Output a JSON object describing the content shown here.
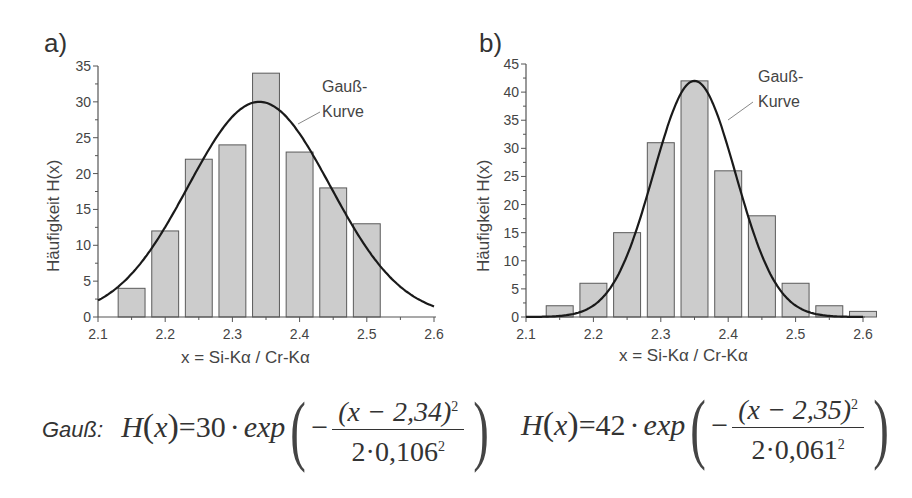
{
  "chart_data": [
    {
      "id": "a",
      "type": "bar",
      "panel_label": "a)",
      "title": "",
      "xlabel": "x = Si-Kα / Cr-Kα",
      "ylabel": "Häufigkeit H(x)",
      "xlim": [
        2.1,
        2.6
      ],
      "ylim": [
        0,
        35
      ],
      "x_ticks": [
        "2.1",
        "2.2",
        "2.3",
        "2.4",
        "2.5",
        "2.6"
      ],
      "y_ticks": [
        "0",
        "5",
        "10",
        "15",
        "20",
        "25",
        "30",
        "35"
      ],
      "grid": false,
      "bar_centers": [
        2.15,
        2.2,
        2.25,
        2.3,
        2.35,
        2.4,
        2.45,
        2.5
      ],
      "values": [
        4,
        12,
        22,
        24,
        34,
        23,
        18,
        13
      ],
      "bar_color": "#cccccc",
      "curve": {
        "name": "Gauß-Kurve",
        "type": "line",
        "amplitude": 30,
        "mean": 2.34,
        "sigma": 0.106
      },
      "annotation": [
        "Gauß-",
        "Kurve"
      ],
      "formula": {
        "prefix": "Gauß:",
        "lhs": "H(x) = 30 · exp",
        "numerator": "(x − 2,34)²",
        "denominator": "2·0,106²",
        "amplitude": "30",
        "mean": "2,34",
        "sigma": "0,106"
      }
    },
    {
      "id": "b",
      "type": "bar",
      "panel_label": "b)",
      "title": "",
      "xlabel": "x = Si-Kα / Cr-Kα",
      "ylabel": "Häufigkeit H(x)",
      "xlim": [
        2.1,
        2.6
      ],
      "ylim": [
        0,
        45
      ],
      "x_ticks": [
        "2.1",
        "2.2",
        "2.3",
        "2.4",
        "2.5",
        "2.6"
      ],
      "y_ticks": [
        "0",
        "5",
        "10",
        "15",
        "20",
        "25",
        "30",
        "35",
        "40",
        "45"
      ],
      "grid": false,
      "bar_centers": [
        2.15,
        2.2,
        2.25,
        2.3,
        2.35,
        2.4,
        2.45,
        2.5,
        2.55,
        2.6
      ],
      "values": [
        2,
        6,
        15,
        31,
        42,
        26,
        18,
        6,
        2,
        1
      ],
      "bar_color": "#cccccc",
      "curve": {
        "name": "Gauß-Kurve",
        "type": "line",
        "amplitude": 42,
        "mean": 2.35,
        "sigma": 0.061
      },
      "annotation": [
        "Gauß-",
        "Kurve"
      ],
      "formula": {
        "prefix": "",
        "lhs": "H(x) = 42 · exp",
        "numerator": "(x − 2,35)²",
        "denominator": "2·0,061²",
        "amplitude": "42",
        "mean": "2,35",
        "sigma": "0,061"
      }
    }
  ],
  "panels": {
    "a": {
      "label": "a)",
      "xlabel": "x = Si-Kα / Cr-Kα",
      "ylabel": "Häufigkeit H(x)",
      "annot1": "Gauß-",
      "annot2": "Kurve",
      "f_prefix": "Gauß:",
      "f_H": "H",
      "f_x": "x",
      "f_eq": "=",
      "f_amp": "30",
      "f_dot": "·",
      "f_exp": "exp",
      "f_minus": "−",
      "f_num": "(x − 2,34)",
      "f_sq": "2",
      "f_den": "2·0,106",
      "f_den_sq": "2"
    },
    "b": {
      "label": "b)",
      "xlabel": "x = Si-Kα / Cr-Kα",
      "ylabel": "Häufigkeit H(x)",
      "annot1": "Gauß-",
      "annot2": "Kurve",
      "f_H": "H",
      "f_x": "x",
      "f_eq": "=",
      "f_amp": "42",
      "f_dot": "·",
      "f_exp": "exp",
      "f_minus": "−",
      "f_num": "(x − 2,35)",
      "f_sq": "2",
      "f_den": "2·0,061",
      "f_den_sq": "2"
    }
  },
  "colors": {
    "bar_fill": "#cccccc",
    "bar_stroke": "#5a5a5a",
    "curve": "#1a1a1a",
    "axis": "#555555",
    "leader": "#888888"
  }
}
